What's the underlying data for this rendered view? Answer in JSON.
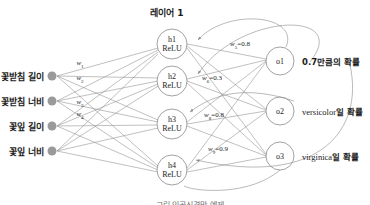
{
  "diagram": {
    "layer_title": "레이어 1",
    "caption": "그림 인공신경망 예제",
    "colors": {
      "stroke": "#8c8c8c",
      "node_stroke": "#7a7a7a",
      "input_dot": "#9a9a9a",
      "text": "#1c1c1c",
      "caption": "#6f6f6f"
    },
    "inputs": [
      {
        "label": "꽃받침 길이",
        "cx": 52,
        "cy": 76
      },
      {
        "label": "꽃받침 너비",
        "cx": 52,
        "cy": 101
      },
      {
        "label": "꽃잎 길이",
        "cx": 52,
        "cy": 126
      },
      {
        "label": "꽃잎 너비",
        "cx": 52,
        "cy": 151
      }
    ],
    "hidden": [
      {
        "id": "h1",
        "act": "ReLU",
        "cx": 172,
        "cy": 44,
        "r": 15
      },
      {
        "id": "h2",
        "act": "ReLU",
        "cx": 172,
        "cy": 81,
        "r": 15
      },
      {
        "id": "h3",
        "act": "ReLU",
        "cx": 172,
        "cy": 124,
        "r": 15
      },
      {
        "id": "h4",
        "act": "ReLU",
        "cx": 172,
        "cy": 170,
        "r": 15
      }
    ],
    "outputs": [
      {
        "id": "o1",
        "cx": 280,
        "cy": 61,
        "r": 14,
        "desc_plain": "0.7만큼의 확률",
        "desc_serif": "",
        "desc_tail": ""
      },
      {
        "id": "o2",
        "cx": 280,
        "cy": 111,
        "r": 14,
        "desc_plain": "",
        "desc_serif": "versicolor",
        "desc_tail": "일 확률"
      },
      {
        "id": "o3",
        "cx": 280,
        "cy": 156,
        "r": 14,
        "desc_plain": "",
        "desc_serif": "virginica",
        "desc_tail": "일 확률"
      }
    ],
    "input_weights": [
      {
        "name": "w",
        "sub": "1",
        "x": 80,
        "y": 64
      },
      {
        "name": "w",
        "sub": "2",
        "x": 80,
        "y": 79
      },
      {
        "name": "w",
        "sub": "3",
        "x": 80,
        "y": 103
      },
      {
        "name": "w",
        "sub": "4",
        "x": 80,
        "y": 115
      }
    ],
    "hidden_weights": [
      {
        "name": "w",
        "sub": "5",
        "value": "0.8",
        "x": 240,
        "y": 45
      },
      {
        "name": "w",
        "sub": "6",
        "value": "0.3",
        "x": 212,
        "y": 79
      },
      {
        "name": "w",
        "sub": "8",
        "value": "0.8",
        "x": 214,
        "y": 116
      },
      {
        "name": "w",
        "sub": "9",
        "value": "0.9",
        "x": 218,
        "y": 150
      }
    ]
  }
}
